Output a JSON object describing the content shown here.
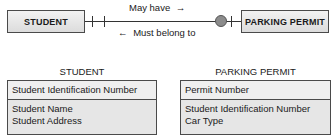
{
  "diagram": {
    "entities": [
      {
        "name": "STUDENT"
      },
      {
        "name": "PARKING PERMIT"
      }
    ],
    "relationship": {
      "forward_label": "May have",
      "forward_arrow": "→",
      "backward_label": "Must belong to",
      "backward_arrow": "←",
      "student_side": "exactly one (double bar)",
      "permit_side": "zero or one (circle + bar)"
    },
    "tables": [
      {
        "title": "STUDENT",
        "primary_key": "Student Identification Number",
        "attributes": [
          "Student Name",
          "Student Address"
        ]
      },
      {
        "title": "PARKING PERMIT",
        "primary_key": "Permit Number",
        "attributes": [
          "Student Identification Number",
          "Car Type"
        ]
      }
    ]
  }
}
